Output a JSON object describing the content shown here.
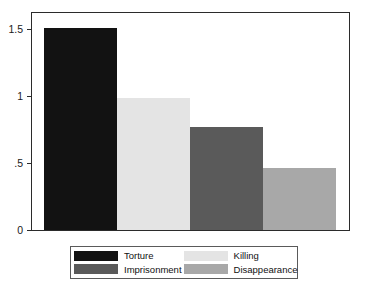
{
  "chart_data": {
    "type": "bar",
    "title": "",
    "subtitle": "",
    "xlabel": "",
    "ylabel": "",
    "categories": [
      "Torture",
      "Killing",
      "Imprisonment",
      "Disappearance"
    ],
    "values": [
      1.39,
      0.91,
      0.71,
      0.43
    ],
    "series": [
      {
        "name": "",
        "values": [
          1.39,
          0.91,
          0.71,
          0.43
        ]
      }
    ],
    "colors": [
      "#121212",
      "#e4e4e4",
      "#5a5a5a",
      "#a8a8a8"
    ],
    "ylim": [
      0,
      1.5
    ],
    "xlim": [
      0,
      4
    ],
    "yticks": [
      0,
      0.5,
      1,
      1.5
    ],
    "ytick_labels": [
      "0",
      ".5",
      "1",
      "1.5"
    ],
    "xtick_labels": [],
    "grid": false,
    "legend_position": "bottom",
    "bar_gap": 0,
    "frame": "box",
    "annotations": []
  },
  "axes": {
    "y": {
      "ticks": [
        {
          "label": "1.5",
          "value": 1.5
        },
        {
          "label": "1",
          "value": 1
        },
        {
          "label": ".5",
          "value": 0.5
        },
        {
          "label": "0",
          "value": 0
        }
      ]
    }
  },
  "legend": {
    "entries": [
      {
        "label": "Torture",
        "color": "#121212"
      },
      {
        "label": "Killing",
        "color": "#e4e4e4"
      },
      {
        "label": "Imprisonment",
        "color": "#5a5a5a"
      },
      {
        "label": "Disappearance",
        "color": "#a8a8a8"
      }
    ]
  }
}
